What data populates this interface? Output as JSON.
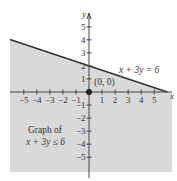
{
  "chart_data": {
    "type": "area",
    "title": "",
    "xlabel": "x",
    "ylabel": "y",
    "xlim": [
      -6.1,
      6.3
    ],
    "ylim": [
      -6.1,
      6.6
    ],
    "x_ticks": [
      -5,
      -4,
      -3,
      -2,
      -1,
      1,
      2,
      3,
      4,
      5
    ],
    "y_ticks": [
      -5,
      -4,
      -3,
      -2,
      -1,
      1,
      2,
      3,
      4,
      5
    ],
    "x_tick_labels": [
      "−5",
      "−4",
      "−3",
      "−2",
      "−1",
      "1",
      "2",
      "3",
      "4",
      "5"
    ],
    "y_tick_labels": [
      "−5",
      "−4",
      "−3",
      "−2",
      "−1",
      "1",
      "2",
      "3",
      "4",
      "5"
    ],
    "grid": false,
    "boundary_line": {
      "equation": "x + 3y = 6",
      "style": "solid",
      "points": [
        [
          -6.1,
          4.03
        ],
        [
          6,
          0
        ]
      ]
    },
    "shaded_region": {
      "inequality": "x + 3y ≤ 6",
      "side": "below",
      "color": "#d9d9d9"
    },
    "test_point": {
      "x": 0,
      "y": 0,
      "label": "(0, 0)"
    },
    "annotations": [
      {
        "text": "x + 3y = 6",
        "x": 2.1,
        "y": 1.5
      },
      {
        "text": "Graph of",
        "x": -4.8,
        "y": -2.7
      },
      {
        "text": "x + 3y ≤ 6",
        "x": -4.8,
        "y": -3.55
      },
      {
        "text": "(0, 0)",
        "x": 0.25,
        "y": 0.6
      }
    ]
  },
  "labels": {
    "line_label": "x + 3y = 6",
    "region_label_1": "Graph of",
    "region_label_2": "x + 3y ≤ 6",
    "point_label": "(0, 0)",
    "x_axis": "x",
    "y_axis": "y"
  },
  "colors": {
    "shade": "#d9d9d9",
    "axis": "#333333",
    "line": "#333333"
  }
}
